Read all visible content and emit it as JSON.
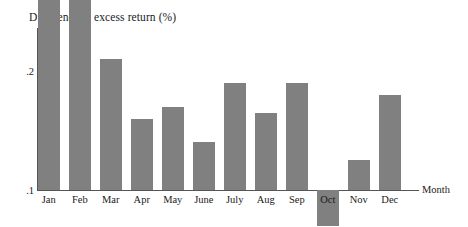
{
  "chart_data": {
    "type": "bar",
    "title": "Difference in excess return (%)",
    "xlabel": "Month",
    "ylabel": "",
    "categories": [
      "Jan",
      "Feb",
      "Mar",
      "Apr",
      "May",
      "June",
      "July",
      "Aug",
      "Sep",
      "Oct",
      "Nov",
      "Dec"
    ],
    "values": [
      0.7,
      0.26,
      0.21,
      0.16,
      0.17,
      0.14,
      0.19,
      0.165,
      0.19,
      0.07,
      0.125,
      0.18
    ],
    "ylim": [
      0.1,
      0.8
    ],
    "baseline": 0.1,
    "yticks": [
      ".1",
      ".2",
      ".3",
      ".4",
      ".5",
      ".6",
      ".7",
      ".8"
    ],
    "ytick_values": [
      0.1,
      0.2,
      0.3,
      0.4,
      0.5,
      0.6,
      0.7,
      0.8
    ],
    "grid": false,
    "legend": false,
    "bar_color": "#808080",
    "axis_color": "#555555",
    "background": "#ffffff"
  }
}
